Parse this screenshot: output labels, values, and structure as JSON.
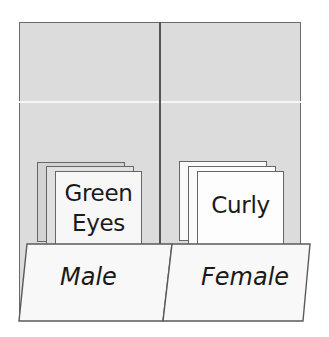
{
  "diagram": {
    "title": "",
    "colors": {
      "background": "#dcdcdc",
      "frame_border": "#6a6a6a",
      "card_gray_back": "#d3d3d3",
      "card_gray_middle": "#e2e2e2",
      "card_front": "#f7f7f7",
      "card_white": "#fbfbfb",
      "tab_fill": "#f8f8f8"
    },
    "compartments": [
      {
        "tab_label": "Male",
        "cards": [
          {
            "label": ""
          },
          {
            "label": ""
          },
          {
            "label": "Green Eyes",
            "lines": [
              "Green",
              "Eyes"
            ]
          }
        ]
      },
      {
        "tab_label": "Female",
        "cards": [
          {
            "label": ""
          },
          {
            "label": ""
          },
          {
            "label": "Curly",
            "lines": [
              "Curly"
            ]
          }
        ]
      }
    ]
  }
}
